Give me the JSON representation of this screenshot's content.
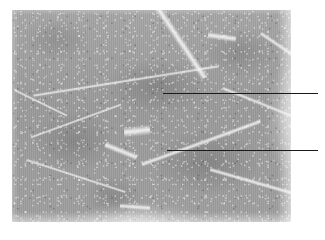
{
  "figure": {
    "kind": "histology-micrograph",
    "background_color": "#ffffff",
    "photo": {
      "x": 12,
      "y": 10,
      "width": 279,
      "height": 212,
      "tissue_color": "#9d9d9d",
      "septum_color": "#f2f2f2",
      "tone_range": [
        "#858585",
        "#c9c9c9"
      ]
    },
    "annotations": [
      {
        "id": "leader-1",
        "label": "",
        "color": "#1a1a1a",
        "x_start": 163,
        "x_end": 318,
        "y": 93,
        "thickness": 1,
        "points_to": "upper muscle fascicle"
      },
      {
        "id": "leader-2",
        "label": "",
        "color": "#1a1a1a",
        "x_start": 167,
        "x_end": 318,
        "y": 150,
        "thickness": 1,
        "points_to": "lower muscle fascicle"
      }
    ],
    "septa": [
      {
        "id": "septum-top-diagonal",
        "x": 118,
        "y": -14,
        "w": 96,
        "h": 84,
        "rot": 56,
        "thickness": 3
      },
      {
        "id": "septum-top-right",
        "x": 196,
        "y": -10,
        "w": 28,
        "h": 74,
        "rot": 8,
        "thickness": 3
      },
      {
        "id": "septum-right-upper",
        "x": 244,
        "y": 16,
        "w": 56,
        "h": 46,
        "rot": 34,
        "thickness": 3
      },
      {
        "id": "septum-central-long",
        "x": 20,
        "y": 58,
        "w": 188,
        "h": 26,
        "rot": -9,
        "thickness": 4
      },
      {
        "id": "septum-left-notch",
        "x": 0,
        "y": 78,
        "w": 58,
        "h": 30,
        "rot": 26,
        "thickness": 3
      },
      {
        "id": "septum-left-cell-top",
        "x": 16,
        "y": 96,
        "w": 96,
        "h": 30,
        "rot": -20,
        "thickness": 3
      },
      {
        "id": "septum-left-cell-right",
        "x": 92,
        "y": 104,
        "w": 34,
        "h": 74,
        "rot": 22,
        "thickness": 3
      },
      {
        "id": "septum-left-cell-bottom",
        "x": 12,
        "y": 150,
        "w": 104,
        "h": 32,
        "rot": 18,
        "thickness": 3
      },
      {
        "id": "septum-mid-vertical",
        "x": 112,
        "y": 66,
        "w": 26,
        "h": 110,
        "rot": -6,
        "thickness": 3
      },
      {
        "id": "septum-mid-diagonal",
        "x": 126,
        "y": 106,
        "w": 126,
        "h": 54,
        "rot": -20,
        "thickness": 3
      },
      {
        "id": "septum-right-mid",
        "x": 208,
        "y": 72,
        "w": 74,
        "h": 40,
        "rot": 22,
        "thickness": 3
      },
      {
        "id": "septum-bottom-right",
        "x": 196,
        "y": 150,
        "w": 112,
        "h": 50,
        "rot": 16,
        "thickness": 3
      },
      {
        "id": "septum-bottom-centre",
        "x": 108,
        "y": 168,
        "w": 30,
        "h": 58,
        "rot": 4,
        "thickness": 3
      },
      {
        "id": "septum-bottom-stub",
        "x": 96,
        "y": 168,
        "w": 44,
        "h": 12,
        "rot": 3,
        "thickness": 2
      }
    ]
  }
}
